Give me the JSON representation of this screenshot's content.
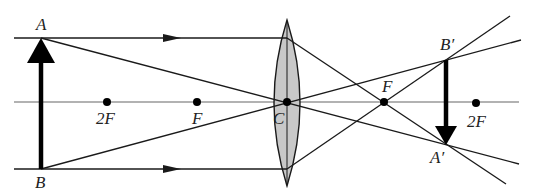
{
  "colors": {
    "ink": "#1a1a1a",
    "axis": "#555555",
    "lens_fill": "#c8c8c8",
    "background": "#ffffff"
  },
  "labels": {
    "object_top": "A",
    "object_bottom": "B",
    "image_top": "B′",
    "image_bottom": "A′",
    "left_2f": "2F",
    "left_f": "F",
    "center": "C",
    "right_f": "F",
    "right_2f": "2F"
  },
  "points": {
    "A": [
      41,
      38
    ],
    "B": [
      41,
      169
    ],
    "C": [
      287,
      102
    ],
    "F_left": [
      197,
      102
    ],
    "F2_left": [
      107,
      102
    ],
    "F_right": [
      384,
      102
    ],
    "F2_right": [
      476,
      102
    ],
    "B_prime": [
      446,
      60
    ],
    "A_prime": [
      446,
      145
    ]
  }
}
